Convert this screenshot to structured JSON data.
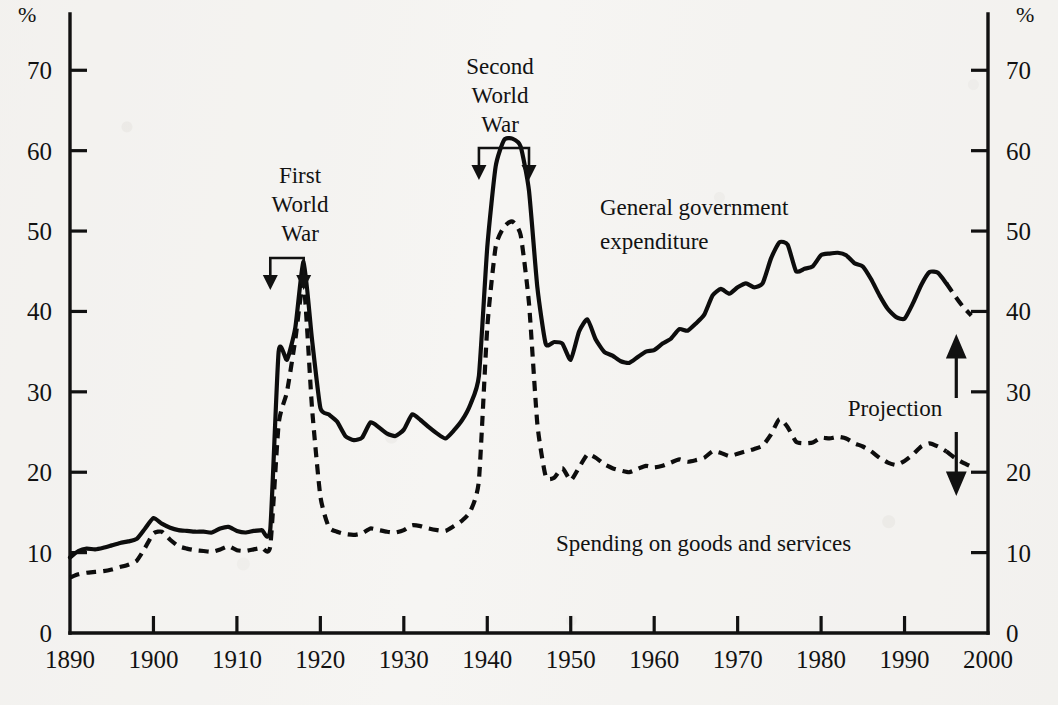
{
  "figure": {
    "left_axis_unit": "%",
    "right_axis_unit": "%",
    "background_color": "#f6f5f3",
    "ink_color": "#0d0d0d"
  },
  "annotations": {
    "ww1": {
      "line1": "First",
      "line2": "World",
      "line3": "War",
      "span_start_year": 1914,
      "span_end_year": 1918
    },
    "ww2": {
      "line1": "Second",
      "line2": "World",
      "line3": "War",
      "span_start_year": 1939,
      "span_end_year": 1945
    },
    "projection": {
      "label": "Projection",
      "start_year": 1995
    }
  },
  "series_labels": {
    "total": "General government\nexpenditure",
    "total_line1": "General government",
    "total_line2": "expenditure",
    "goods": "Spending on goods and services"
  },
  "chart_data": {
    "type": "line",
    "title": "",
    "subtitle": "",
    "xlabel": "",
    "ylabel": "%",
    "y2label": "%",
    "xlim": [
      1890,
      2000
    ],
    "ylim": [
      0,
      77
    ],
    "yticks": [
      0,
      10,
      20,
      30,
      40,
      50,
      60,
      70
    ],
    "ytick_labels": [
      "0",
      "10",
      "20",
      "30",
      "40",
      "50",
      "60",
      "70"
    ],
    "xticks": [
      1890,
      1900,
      1910,
      1920,
      1930,
      1940,
      1950,
      1960,
      1970,
      1980,
      1990,
      2000
    ],
    "xtick_labels": [
      "1890",
      "1900",
      "1910",
      "1920",
      "1930",
      "1940",
      "1950",
      "1960",
      "1970",
      "1980",
      "1990",
      "2000"
    ],
    "grid": false,
    "legend": "inline-labels",
    "projection_starts": 1995,
    "series": [
      {
        "name": "General government expenditure",
        "style": "solid",
        "x": [
          1890,
          1891,
          1892,
          1893,
          1894,
          1895,
          1896,
          1897,
          1898,
          1899,
          1900,
          1901,
          1902,
          1903,
          1904,
          1905,
          1906,
          1907,
          1908,
          1909,
          1910,
          1911,
          1912,
          1913,
          1914,
          1915,
          1916,
          1917,
          1918,
          1919,
          1920,
          1921,
          1922,
          1923,
          1924,
          1925,
          1926,
          1927,
          1928,
          1929,
          1930,
          1931,
          1932,
          1933,
          1934,
          1935,
          1936,
          1937,
          1938,
          1939,
          1940,
          1941,
          1942,
          1943,
          1944,
          1945,
          1946,
          1947,
          1948,
          1949,
          1950,
          1951,
          1952,
          1953,
          1954,
          1955,
          1956,
          1957,
          1958,
          1959,
          1960,
          1961,
          1962,
          1963,
          1964,
          1965,
          1966,
          1967,
          1968,
          1969,
          1970,
          1971,
          1972,
          1973,
          1974,
          1975,
          1976,
          1977,
          1978,
          1979,
          1980,
          1981,
          1982,
          1983,
          1984,
          1985,
          1986,
          1987,
          1988,
          1989,
          1990,
          1991,
          1992,
          1993,
          1994,
          1995,
          1996,
          1997,
          1998
        ],
        "y": [
          9.4,
          10.2,
          10.5,
          10.4,
          10.6,
          10.9,
          11.2,
          11.4,
          11.7,
          13.0,
          14.3,
          13.6,
          13.1,
          12.8,
          12.7,
          12.6,
          12.6,
          12.5,
          13.0,
          13.2,
          12.7,
          12.5,
          12.7,
          12.8,
          12.9,
          35.0,
          34.0,
          38.0,
          46.2,
          36.5,
          28.0,
          27.2,
          26.3,
          24.5,
          24.0,
          24.3,
          26.2,
          25.6,
          24.8,
          24.5,
          25.3,
          27.2,
          26.5,
          25.6,
          24.8,
          24.2,
          25.2,
          26.5,
          28.5,
          32.0,
          48.0,
          58.0,
          61.3,
          61.5,
          60.5,
          55.0,
          43.0,
          36.0,
          36.2,
          36.0,
          34.0,
          37.5,
          39.0,
          36.5,
          35.0,
          34.5,
          33.8,
          33.6,
          34.3,
          35.0,
          35.2,
          36.0,
          36.6,
          37.8,
          37.6,
          38.5,
          39.6,
          42.0,
          42.8,
          42.2,
          43.0,
          43.5,
          43.0,
          43.5,
          46.6,
          48.6,
          48.3,
          45.0,
          45.3,
          45.6,
          47.0,
          47.2,
          47.3,
          47.0,
          46.0,
          45.6,
          44.0,
          42.0,
          40.3,
          39.3,
          39.1,
          41.0,
          43.3,
          44.9,
          44.8,
          43.5,
          42.0,
          40.6,
          39.5
        ],
        "peaks": [
          {
            "year": 1918,
            "value": 46.2,
            "note": "First World War peak"
          },
          {
            "year": 1943,
            "value": 61.5,
            "note": "Second World War peak"
          },
          {
            "year": 1975,
            "value": 48.6,
            "note": "mid-1970s peak"
          }
        ]
      },
      {
        "name": "Spending on goods and services",
        "style": "dashed",
        "x": [
          1890,
          1891,
          1892,
          1893,
          1894,
          1895,
          1896,
          1897,
          1898,
          1899,
          1900,
          1901,
          1902,
          1903,
          1904,
          1905,
          1906,
          1907,
          1908,
          1909,
          1910,
          1911,
          1912,
          1913,
          1914,
          1915,
          1916,
          1917,
          1918,
          1919,
          1920,
          1921,
          1922,
          1923,
          1924,
          1925,
          1926,
          1927,
          1928,
          1929,
          1930,
          1931,
          1932,
          1933,
          1934,
          1935,
          1936,
          1937,
          1938,
          1939,
          1940,
          1941,
          1942,
          1943,
          1944,
          1945,
          1946,
          1947,
          1948,
          1949,
          1950,
          1951,
          1952,
          1953,
          1954,
          1955,
          1956,
          1957,
          1958,
          1959,
          1960,
          1961,
          1962,
          1963,
          1964,
          1965,
          1966,
          1967,
          1968,
          1969,
          1970,
          1971,
          1972,
          1973,
          1974,
          1975,
          1976,
          1977,
          1978,
          1979,
          1980,
          1981,
          1982,
          1983,
          1984,
          1985,
          1986,
          1987,
          1988,
          1989,
          1990,
          1991,
          1992,
          1993,
          1994,
          1995,
          1996,
          1997,
          1998
        ],
        "y": [
          6.9,
          7.3,
          7.5,
          7.6,
          7.7,
          7.9,
          8.2,
          8.5,
          9.0,
          10.6,
          12.4,
          12.6,
          11.6,
          10.8,
          10.5,
          10.3,
          10.2,
          10.1,
          10.4,
          10.8,
          10.3,
          10.2,
          10.4,
          10.6,
          10.8,
          26.0,
          30.0,
          36.5,
          43.5,
          28.0,
          17.0,
          13.2,
          12.6,
          12.3,
          12.2,
          12.4,
          13.0,
          12.8,
          12.6,
          12.5,
          12.8,
          13.4,
          13.3,
          13.0,
          12.8,
          12.7,
          13.3,
          14.0,
          15.2,
          19.0,
          38.0,
          48.0,
          50.5,
          51.2,
          49.5,
          41.0,
          26.0,
          19.5,
          19.3,
          20.5,
          19.0,
          20.6,
          22.2,
          21.8,
          21.0,
          20.5,
          20.2,
          20.0,
          20.4,
          20.8,
          20.6,
          20.8,
          21.2,
          21.6,
          21.3,
          21.5,
          21.8,
          22.6,
          22.4,
          22.0,
          22.3,
          22.6,
          22.9,
          23.3,
          24.7,
          26.6,
          25.6,
          23.8,
          23.6,
          23.7,
          24.3,
          24.2,
          24.4,
          24.2,
          23.6,
          23.2,
          22.6,
          21.8,
          21.2,
          20.9,
          21.4,
          22.2,
          23.2,
          23.6,
          23.2,
          22.6,
          21.8,
          21.2,
          20.7
        ],
        "peaks": [
          {
            "year": 1918,
            "value": 43.5,
            "note": "First World War peak"
          },
          {
            "year": 1943,
            "value": 51.2,
            "note": "Second World War peak"
          },
          {
            "year": 1975,
            "value": 26.6,
            "note": "mid-1970s peak"
          }
        ]
      }
    ]
  }
}
